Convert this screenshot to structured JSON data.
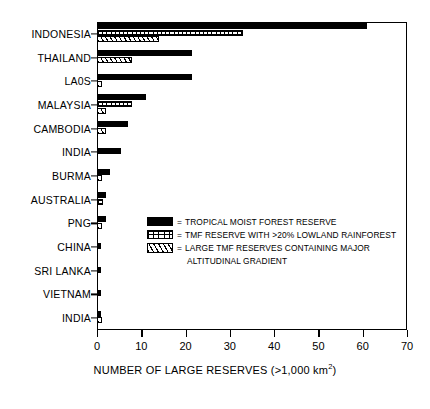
{
  "chart_data": {
    "type": "bar",
    "orientation": "horizontal",
    "title": "",
    "xlabel": "NUMBER OF LARGE RESERVES (>1,000 km2)",
    "xlabel_parts": {
      "main": "NUMBER OF LARGE RESERVES (>1,000 km",
      "sup": "2",
      "tail": ")"
    },
    "ylabel": "",
    "xlim": [
      0,
      70
    ],
    "xticks": [
      "0",
      "10",
      "20",
      "30",
      "40",
      "50",
      "60",
      "70"
    ],
    "xtick_values": [
      0,
      10,
      20,
      30,
      40,
      50,
      60,
      70
    ],
    "grid": false,
    "legend_position": "inside-lower-center",
    "categories": [
      "INDONESIA",
      "THAILAND",
      "LA0S",
      "MALAYSIA",
      "CAMBODIA",
      "INDIA",
      "BURMA",
      "AUSTRALIA",
      "PNG",
      "CHINA",
      "SRI LANKA",
      "VIETNAM",
      "INDIA"
    ],
    "series": [
      {
        "name": "TROPICAL MOIST FOREST RESERVE",
        "key": "solid",
        "pattern": "solid-black",
        "color": "#000000",
        "values": [
          61,
          21.5,
          21.5,
          11,
          7,
          5.5,
          3,
          2,
          2,
          1,
          1,
          1,
          1
        ]
      },
      {
        "name": "TMF RESERVE WITH >20% LOWLAND RAINFOREST",
        "key": "grid",
        "pattern": "grid-crosshatch",
        "color": "#000000",
        "values": [
          33,
          0,
          0,
          8,
          0,
          0,
          0,
          1.3,
          0,
          0,
          0,
          0,
          0
        ]
      },
      {
        "name": "LARGE TMF RESERVES CONTAINING MAJOR ALTITUDINAL GRADIENT",
        "key": "hatch",
        "pattern": "diagonal-hatch",
        "color": "#000000",
        "values": [
          14,
          8,
          1.2,
          2,
          2,
          0,
          1.2,
          0,
          1.2,
          0,
          0,
          0,
          1.2
        ]
      }
    ]
  },
  "legend": {
    "items": [
      {
        "swatch": "solid",
        "eq": "=",
        "label": "TROPICAL MOIST FOREST RESERVE"
      },
      {
        "swatch": "grid",
        "eq": "=",
        "label": "TMF RESERVE WITH >20% LOWLAND RAINFOREST"
      },
      {
        "swatch": "hatch",
        "eq": "=",
        "label": "LARGE TMF RESERVES CONTAINING MAJOR"
      }
    ],
    "continuation": "ALTITUDINAL GRADIENT"
  }
}
